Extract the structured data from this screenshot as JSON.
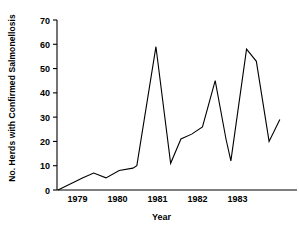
{
  "chart_data": {
    "type": "line",
    "title": "",
    "xlabel": "Year",
    "ylabel": "No. Herds with Confirmed Salmonellosis",
    "ylim": [
      0,
      70
    ],
    "xlim": [
      1978.55,
      1983.45
    ],
    "yticks": [
      0,
      10,
      20,
      30,
      40,
      50,
      60,
      70
    ],
    "ytick_labels": [
      "0",
      "10",
      "20",
      "30",
      "40",
      "50",
      "60",
      "70"
    ],
    "xticks": [
      1979,
      1980,
      1981,
      1982,
      1983
    ],
    "xtick_labels": [
      "1979",
      "1980",
      "1981",
      "1982",
      "1983"
    ],
    "grid": false,
    "legend": null,
    "line_color": "#000000",
    "series": [
      {
        "name": "Herds with confirmed salmonellosis",
        "x": [
          1978.57,
          1979.08,
          1979.3,
          1979.55,
          1979.82,
          1980.1,
          1980.18,
          1980.57,
          1980.87,
          1981.08,
          1981.3,
          1981.52,
          1981.78,
          1982.0,
          1982.1,
          1982.42,
          1982.62,
          1982.88,
          1983.1
        ],
        "y": [
          0,
          5,
          7,
          5,
          8,
          9,
          10,
          59,
          11,
          21,
          23,
          26,
          45,
          21,
          12,
          58,
          53,
          20,
          29
        ]
      }
    ]
  },
  "axis": {
    "ytick_labels": [
      "70",
      "60",
      "50",
      "40",
      "30",
      "20",
      "10",
      "0"
    ],
    "xtick_labels": [
      "1979",
      "1980",
      "1981",
      "1982",
      "1983"
    ]
  },
  "labels": {
    "y_axis_title": "No. Herds with Confirmed Salmonellosis",
    "x_axis_title": "Year"
  }
}
